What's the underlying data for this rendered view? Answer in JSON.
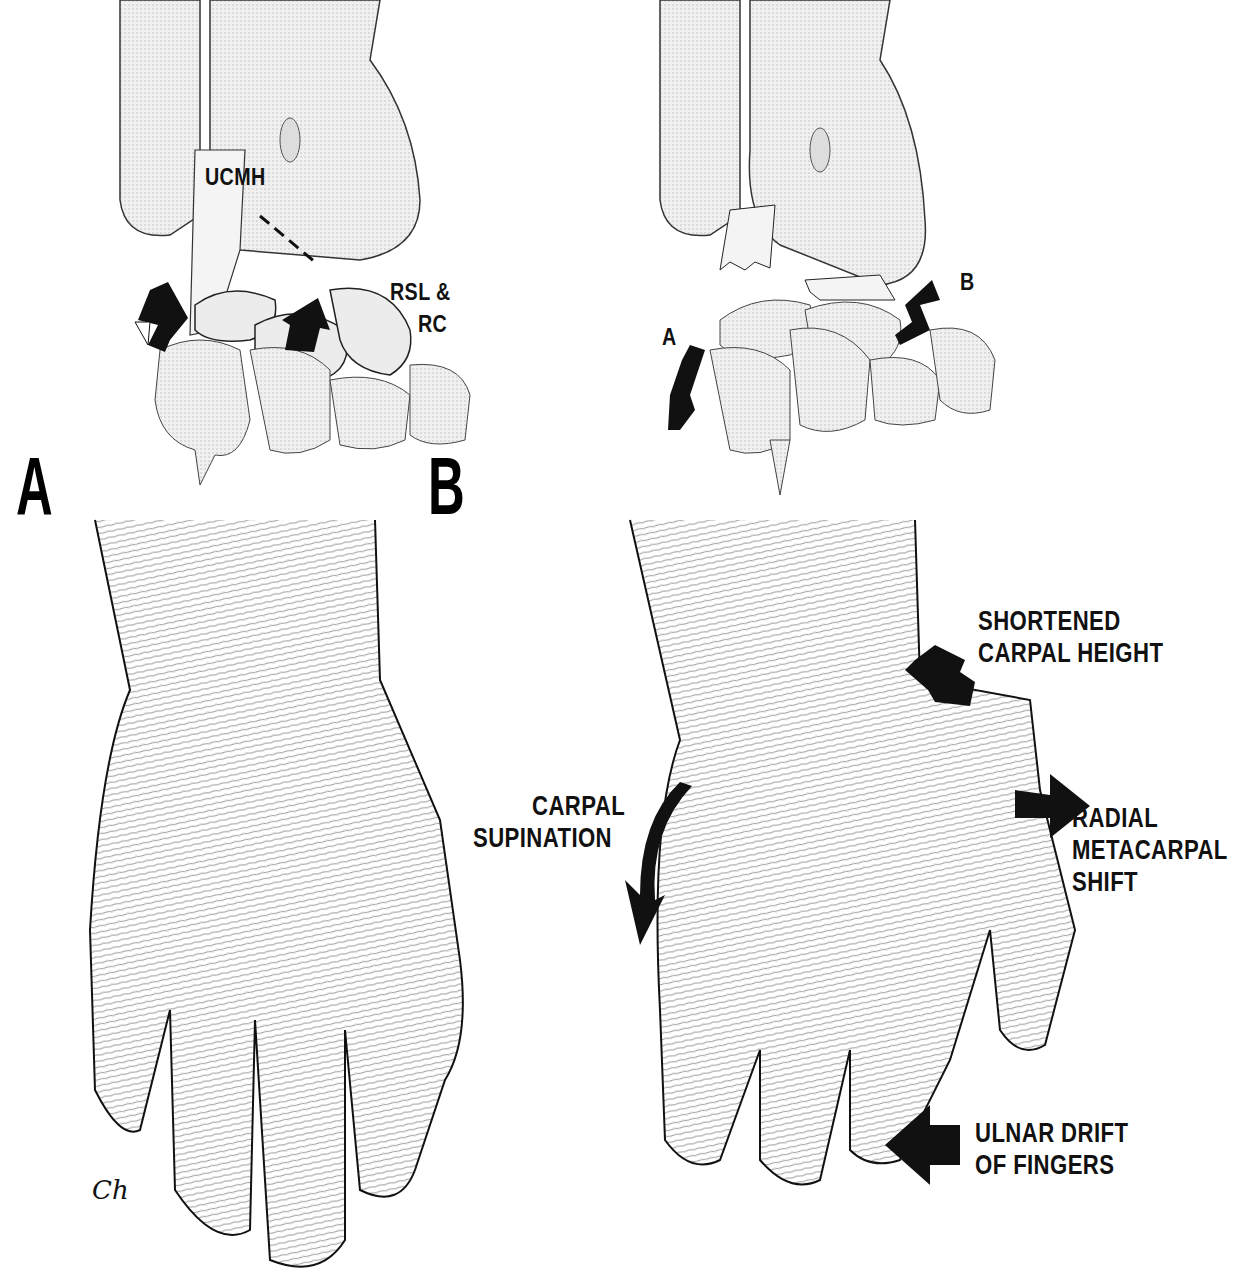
{
  "figure": {
    "panels": [
      {
        "id": "A",
        "letter": "A",
        "top_labels": {
          "ligament_1": "UCMH",
          "ligament_2_line1": "RSL &",
          "ligament_2_line2": "RC"
        }
      },
      {
        "id": "B",
        "letter": "B",
        "top_labels": {
          "arrow_a": "A",
          "arrow_b": "B"
        },
        "hand_labels": {
          "shortened_line1": "SHORTENED",
          "shortened_line2": "CARPAL HEIGHT",
          "supination_line1": "CARPAL",
          "supination_line2": "SUPINATION",
          "radial_line1": "RADIAL",
          "radial_line2": "METACARPAL",
          "radial_line3": "SHIFT",
          "ulnar_line1": "ULNAR DRIFT",
          "ulnar_line2": "OF FINGERS"
        }
      }
    ],
    "signature": "Ch"
  },
  "colors": {
    "ink": "#111111",
    "bone_fill": "#ececec",
    "bone_shade": "#cfcfcf",
    "paper": "#ffffff"
  }
}
